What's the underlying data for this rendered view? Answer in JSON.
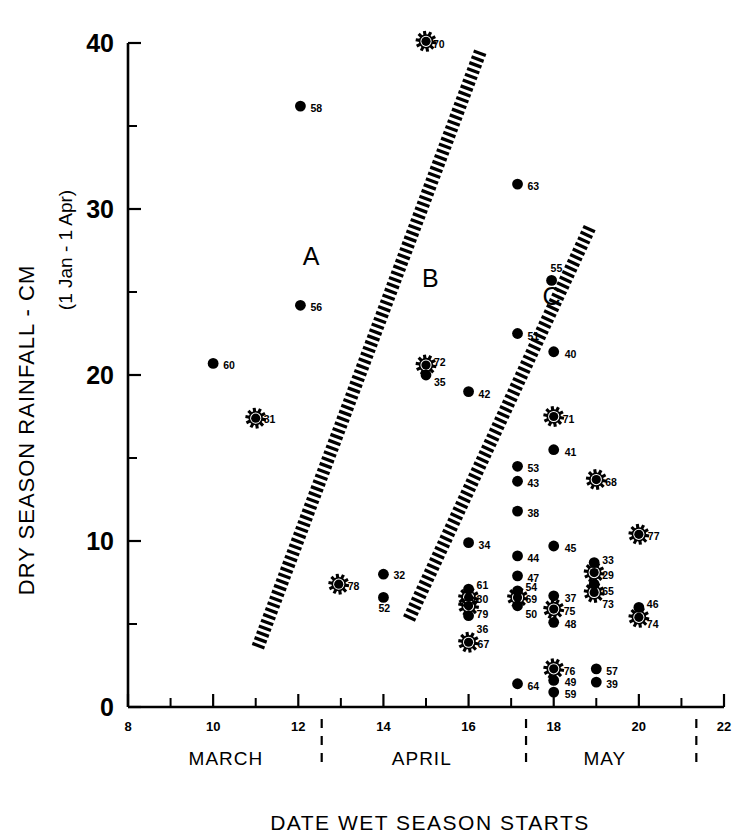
{
  "chart_data": {
    "type": "scatter",
    "title": "",
    "xlabel": "DATE WET SEASON STARTS",
    "ylabel": "DRY SEASON RAINFALL - CM",
    "ylabel_sub": "(1 Jan - 1 Apr)",
    "xlim": [
      8,
      22
    ],
    "ylim": [
      0,
      40
    ],
    "grid": false,
    "legend": "none",
    "x_ticks_major": [
      8,
      10,
      12,
      14,
      16,
      18,
      20,
      22
    ],
    "x_ticks_minor": [
      9,
      11,
      13,
      15,
      17,
      19,
      21
    ],
    "y_ticks_major": [
      0,
      10,
      20,
      30,
      40
    ],
    "y_ticks_minor": [
      5,
      15,
      25,
      35
    ],
    "x_tick_labels": [
      "8",
      "10",
      "12",
      "14",
      "16",
      "18",
      "20",
      "22"
    ],
    "y_tick_labels": [
      "0",
      "10",
      "20",
      "30",
      "40"
    ],
    "month_bands": [
      {
        "label": "MARCH",
        "center": 10.3,
        "start": 8.0,
        "end": 12.55
      },
      {
        "label": "APRIL",
        "center": 14.9,
        "start": 12.55,
        "end": 17.35
      },
      {
        "label": "MAY",
        "center": 19.2,
        "start": 17.35,
        "end": 21.35
      }
    ],
    "month_divider_x": [
      12.55,
      17.35,
      21.35
    ],
    "region_labels": [
      {
        "label": "A",
        "x": 12.3,
        "y": 26.6
      },
      {
        "label": "B",
        "x": 15.1,
        "y": 25.3
      },
      {
        "label": "C",
        "x": 17.95,
        "y": 24.2
      }
    ],
    "boundaries": [
      {
        "name": "A-B boundary",
        "x1": 11.05,
        "y1": 3.6,
        "x2": 16.25,
        "y2": 39.3
      },
      {
        "name": "B-C boundary",
        "x1": 14.6,
        "y1": 5.3,
        "x2": 18.85,
        "y2": 28.9
      }
    ],
    "marker_types": {
      "dot": "plain filled circle",
      "star": "filled circle with radiating spikes"
    },
    "points": [
      {
        "label": "70",
        "x": 15.0,
        "y": 40.1,
        "marker": "star",
        "lx": 7,
        "ly": 3
      },
      {
        "label": "58",
        "x": 12.05,
        "y": 36.2,
        "marker": "dot",
        "lx": 10,
        "ly": 2
      },
      {
        "label": "63",
        "x": 17.15,
        "y": 31.5,
        "marker": "dot",
        "lx": 10,
        "ly": 2
      },
      {
        "label": "55",
        "x": 17.95,
        "y": 25.7,
        "marker": "dot",
        "lx": -1,
        "ly": -12
      },
      {
        "label": "56",
        "x": 12.05,
        "y": 24.2,
        "marker": "dot",
        "lx": 10,
        "ly": 2
      },
      {
        "label": "51",
        "x": 17.15,
        "y": 22.5,
        "marker": "dot",
        "lx": 10,
        "ly": 2
      },
      {
        "label": "40",
        "x": 18.0,
        "y": 21.4,
        "marker": "dot",
        "lx": 11,
        "ly": 2
      },
      {
        "label": "60",
        "x": 10.0,
        "y": 20.7,
        "marker": "dot",
        "lx": 10,
        "ly": 2
      },
      {
        "label": "72",
        "x": 15.0,
        "y": 20.6,
        "marker": "star",
        "lx": 8,
        "ly": -3
      },
      {
        "label": "35",
        "x": 15.0,
        "y": 20.0,
        "marker": "dot",
        "lx": 8,
        "ly": 7
      },
      {
        "label": "42",
        "x": 16.0,
        "y": 19.0,
        "marker": "dot",
        "lx": 10,
        "ly": 2
      },
      {
        "label": "71",
        "x": 18.0,
        "y": 17.5,
        "marker": "star",
        "lx": 9,
        "ly": 2
      },
      {
        "label": "31",
        "x": 11.0,
        "y": 17.4,
        "marker": "star",
        "lx": 8,
        "ly": 1
      },
      {
        "label": "41",
        "x": 18.0,
        "y": 15.5,
        "marker": "dot",
        "lx": 11,
        "ly": 2
      },
      {
        "label": "53",
        "x": 17.15,
        "y": 14.5,
        "marker": "dot",
        "lx": 10,
        "ly": 2
      },
      {
        "label": "43",
        "x": 17.15,
        "y": 13.6,
        "marker": "dot",
        "lx": 10,
        "ly": 2
      },
      {
        "label": "68",
        "x": 19.0,
        "y": 13.7,
        "marker": "star",
        "lx": 9,
        "ly": 2
      },
      {
        "label": "38",
        "x": 17.15,
        "y": 11.8,
        "marker": "dot",
        "lx": 10,
        "ly": 2
      },
      {
        "label": "77",
        "x": 20.0,
        "y": 10.4,
        "marker": "star",
        "lx": 9,
        "ly": 2
      },
      {
        "label": "34",
        "x": 16.0,
        "y": 9.9,
        "marker": "dot",
        "lx": 10,
        "ly": 2
      },
      {
        "label": "45",
        "x": 18.0,
        "y": 9.7,
        "marker": "dot",
        "lx": 11,
        "ly": 2
      },
      {
        "label": "44",
        "x": 17.15,
        "y": 9.1,
        "marker": "dot",
        "lx": 10,
        "ly": 2
      },
      {
        "label": "33",
        "x": 18.95,
        "y": 8.7,
        "marker": "dot",
        "lx": 8,
        "ly": -3
      },
      {
        "label": "29",
        "x": 18.95,
        "y": 8.1,
        "marker": "star",
        "lx": 8,
        "ly": 2
      },
      {
        "label": "32",
        "x": 14.0,
        "y": 8.0,
        "marker": "dot",
        "lx": 10,
        "ly": 1
      },
      {
        "label": "47",
        "x": 17.15,
        "y": 7.9,
        "marker": "dot",
        "lx": 10,
        "ly": 2
      },
      {
        "label": "65",
        "x": 18.95,
        "y": 7.4,
        "marker": "dot",
        "lx": 8,
        "ly": 7
      },
      {
        "label": "73",
        "x": 18.95,
        "y": 6.9,
        "marker": "star",
        "lx": 8,
        "ly": 12
      },
      {
        "label": "78",
        "x": 12.95,
        "y": 7.4,
        "marker": "star",
        "lx": 9,
        "ly": 2
      },
      {
        "label": "61",
        "x": 16.0,
        "y": 7.1,
        "marker": "dot",
        "lx": 8,
        "ly": -4
      },
      {
        "label": "54",
        "x": 17.15,
        "y": 7.0,
        "marker": "dot",
        "lx": 8,
        "ly": -4
      },
      {
        "label": "52",
        "x": 14.0,
        "y": 6.6,
        "marker": "dot",
        "lx": -5,
        "ly": 11
      },
      {
        "label": "30",
        "x": 16.0,
        "y": 6.6,
        "marker": "star",
        "lx": 8,
        "ly": 2
      },
      {
        "label": "69",
        "x": 17.15,
        "y": 6.6,
        "marker": "star",
        "lx": 8,
        "ly": 2
      },
      {
        "label": "37",
        "x": 18.0,
        "y": 6.7,
        "marker": "dot",
        "lx": 11,
        "ly": 2
      },
      {
        "label": "79",
        "x": 16.0,
        "y": 6.1,
        "marker": "star",
        "lx": 8,
        "ly": 8
      },
      {
        "label": "50",
        "x": 17.15,
        "y": 6.1,
        "marker": "dot",
        "lx": 8,
        "ly": 8
      },
      {
        "label": "75",
        "x": 18.0,
        "y": 5.9,
        "marker": "star",
        "lx": 10,
        "ly": 2
      },
      {
        "label": "46",
        "x": 20.0,
        "y": 6.0,
        "marker": "dot",
        "lx": 8,
        "ly": -3
      },
      {
        "label": "36",
        "x": 16.0,
        "y": 5.5,
        "marker": "dot",
        "lx": 8,
        "ly": 13
      },
      {
        "label": "74",
        "x": 20.0,
        "y": 5.4,
        "marker": "star",
        "lx": 8,
        "ly": 7
      },
      {
        "label": "48",
        "x": 18.0,
        "y": 5.1,
        "marker": "dot",
        "lx": 11,
        "ly": 2
      },
      {
        "label": "67",
        "x": 16.0,
        "y": 3.9,
        "marker": "star",
        "lx": 9,
        "ly": 2
      },
      {
        "label": "76",
        "x": 18.0,
        "y": 2.3,
        "marker": "star",
        "lx": 10,
        "ly": 2
      },
      {
        "label": "57",
        "x": 19.0,
        "y": 2.3,
        "marker": "dot",
        "lx": 10,
        "ly": 2
      },
      {
        "label": "49",
        "x": 18.0,
        "y": 1.6,
        "marker": "dot",
        "lx": 11,
        "ly": 2
      },
      {
        "label": "39",
        "x": 19.0,
        "y": 1.5,
        "marker": "dot",
        "lx": 10,
        "ly": 2
      },
      {
        "label": "64",
        "x": 17.15,
        "y": 1.4,
        "marker": "dot",
        "lx": 10,
        "ly": 2
      },
      {
        "label": "59",
        "x": 18.0,
        "y": 0.9,
        "marker": "dot",
        "lx": 11,
        "ly": 2
      }
    ]
  },
  "colors": {
    "ink": "#000000",
    "background": "#ffffff"
  }
}
